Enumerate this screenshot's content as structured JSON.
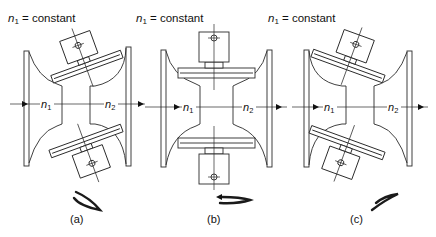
{
  "figure": {
    "panels": [
      {
        "id": "a",
        "caption": "(a)",
        "header": {
          "var": "n",
          "sub": "1",
          "rest": " = constant"
        },
        "input_label": {
          "var": "n",
          "sub": "1"
        },
        "output_label": {
          "var": "n",
          "sub": "2"
        },
        "roller_tilt": "tilted counter-clockwise (toward input)",
        "rotation_icon": "spiral-rotation-arrow-down-right"
      },
      {
        "id": "b",
        "caption": "(b)",
        "header": {
          "var": "n",
          "sub": "1",
          "rest": " = constant"
        },
        "input_label": {
          "var": "n",
          "sub": "1"
        },
        "output_label": {
          "var": "n",
          "sub": "2"
        },
        "roller_tilt": "horizontal (neutral)",
        "rotation_icon": "spiral-rotation-arrow-flat"
      },
      {
        "id": "c",
        "caption": "(c)",
        "header": {
          "var": "n",
          "sub": "1",
          "rest": " = constant"
        },
        "input_label": {
          "var": "n",
          "sub": "1"
        },
        "output_label": {
          "var": "n",
          "sub": "2"
        },
        "roller_tilt": "tilted clockwise (toward output)",
        "rotation_icon": "spiral-rotation-arrow-up-right"
      }
    ],
    "colors": {
      "line": "#2a2a2a",
      "background": "#ffffff",
      "text": "#111111"
    }
  }
}
